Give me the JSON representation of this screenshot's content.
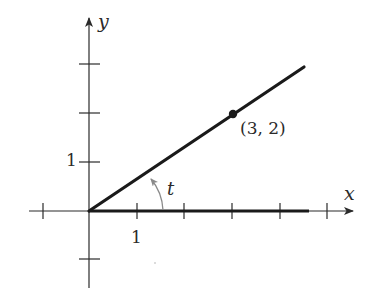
{
  "diagram": {
    "type": "coordinate-plane",
    "axes": {
      "x_label": "x",
      "y_label": "y",
      "x_ticks": [
        -1,
        1,
        2,
        3,
        4,
        5
      ],
      "y_ticks": [
        -1,
        1,
        2,
        3
      ],
      "x_tick_label": "1",
      "y_tick_label": "1"
    },
    "point": {
      "label": "(3, 2)",
      "x": 3,
      "y": 2
    },
    "angle": {
      "label": "t"
    },
    "ray": {
      "from": [
        0,
        0
      ],
      "through": [
        3,
        2
      ]
    },
    "initial_side": {
      "from": [
        0,
        0
      ],
      "to": [
        4.6,
        0
      ]
    },
    "colors": {
      "line": "#1a1a1a",
      "axis": "#2a2a2a",
      "arc": "#8a8a8a"
    }
  }
}
